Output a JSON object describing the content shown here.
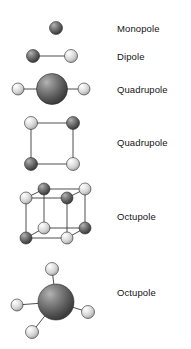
{
  "figure": {
    "background": "#ffffff",
    "bond_color": "#3a3a3a",
    "colors": {
      "sphere_dark": "#4f4f4f",
      "sphere_dark_highlight": "#9a9a9a",
      "sphere_light": "#dcdcdc",
      "sphere_light_highlight": "#ffffff",
      "sphere_mid": "#8a8a8a",
      "sphere_mid_highlight": "#c8c8c8",
      "outline": "#2b2b2b",
      "text": "#141414"
    },
    "rows": [
      {
        "id": "monopole",
        "label": "Monopole",
        "arrangement": "single-sphere",
        "sphere_count": 1,
        "spheres": [
          {
            "cx": 56,
            "cy": 28,
            "r": 6.5,
            "shade": "dark"
          }
        ],
        "bonds": []
      },
      {
        "id": "dipole",
        "label": "Dipole",
        "arrangement": "two-spheres-linear",
        "sphere_count": 2,
        "spheres": [
          {
            "cx": 33,
            "cy": 56,
            "r": 6.5,
            "shade": "dark"
          },
          {
            "cx": 71,
            "cy": 56,
            "r": 6.5,
            "shade": "light"
          }
        ],
        "bonds": [
          {
            "x1": 33,
            "y1": 56,
            "x2": 71,
            "y2": 56
          }
        ]
      },
      {
        "id": "quadrupole-linear",
        "label": "Quadrupole",
        "arrangement": "linear-three-spheres",
        "sphere_count": 3,
        "spheres": [
          {
            "cx": 18,
            "cy": 89,
            "r": 6.0,
            "shade": "light"
          },
          {
            "cx": 52,
            "cy": 89,
            "r": 15.5,
            "shade": "dark"
          },
          {
            "cx": 84,
            "cy": 89,
            "r": 6.0,
            "shade": "light"
          }
        ],
        "bonds": [
          {
            "x1": 18,
            "y1": 89,
            "x2": 52,
            "y2": 89
          },
          {
            "x1": 52,
            "y1": 89,
            "x2": 84,
            "y2": 89
          }
        ]
      },
      {
        "id": "quadrupole-square",
        "label": "Quadrupole",
        "arrangement": "square-four-spheres",
        "sphere_count": 4,
        "spheres": [
          {
            "cx": 31,
            "cy": 123,
            "r": 6.5,
            "shade": "light"
          },
          {
            "cx": 73,
            "cy": 123,
            "r": 6.5,
            "shade": "dark"
          },
          {
            "cx": 31,
            "cy": 164,
            "r": 6.5,
            "shade": "dark"
          },
          {
            "cx": 73,
            "cy": 164,
            "r": 6.5,
            "shade": "light"
          }
        ],
        "bonds": [
          {
            "x1": 31,
            "y1": 123,
            "x2": 73,
            "y2": 123
          },
          {
            "x1": 73,
            "y1": 123,
            "x2": 73,
            "y2": 164
          },
          {
            "x1": 73,
            "y1": 164,
            "x2": 31,
            "y2": 164
          },
          {
            "x1": 31,
            "y1": 164,
            "x2": 31,
            "y2": 123
          }
        ]
      },
      {
        "id": "octupole-cube",
        "label": "Octupole",
        "arrangement": "cube-eight-spheres",
        "sphere_count": 8,
        "spheres": [
          {
            "cx": 26,
            "cy": 198,
            "r": 6.0,
            "shade": "light"
          },
          {
            "cx": 67,
            "cy": 198,
            "r": 6.0,
            "shade": "dark"
          },
          {
            "cx": 26,
            "cy": 238,
            "r": 6.0,
            "shade": "dark"
          },
          {
            "cx": 67,
            "cy": 238,
            "r": 6.0,
            "shade": "light"
          },
          {
            "cx": 44,
            "cy": 189,
            "r": 6.0,
            "shade": "dark"
          },
          {
            "cx": 85,
            "cy": 189,
            "r": 6.0,
            "shade": "light"
          },
          {
            "cx": 44,
            "cy": 228,
            "r": 6.0,
            "shade": "light"
          },
          {
            "cx": 85,
            "cy": 228,
            "r": 6.0,
            "shade": "dark"
          }
        ],
        "bonds": [
          {
            "x1": 26,
            "y1": 198,
            "x2": 67,
            "y2": 198
          },
          {
            "x1": 67,
            "y1": 198,
            "x2": 67,
            "y2": 238
          },
          {
            "x1": 67,
            "y1": 238,
            "x2": 26,
            "y2": 238
          },
          {
            "x1": 26,
            "y1": 238,
            "x2": 26,
            "y2": 198
          },
          {
            "x1": 44,
            "y1": 189,
            "x2": 85,
            "y2": 189
          },
          {
            "x1": 85,
            "y1": 189,
            "x2": 85,
            "y2": 228
          },
          {
            "x1": 85,
            "y1": 228,
            "x2": 44,
            "y2": 228
          },
          {
            "x1": 44,
            "y1": 228,
            "x2": 44,
            "y2": 189
          },
          {
            "x1": 26,
            "y1": 198,
            "x2": 44,
            "y2": 189
          },
          {
            "x1": 67,
            "y1": 198,
            "x2": 85,
            "y2": 189
          },
          {
            "x1": 26,
            "y1": 238,
            "x2": 44,
            "y2": 228
          },
          {
            "x1": 67,
            "y1": 238,
            "x2": 85,
            "y2": 228
          }
        ]
      },
      {
        "id": "octupole-tetrahedral",
        "label": "Octupole",
        "arrangement": "tetrahedral-central-sphere",
        "sphere_count": 5,
        "spheres": [
          {
            "cx": 56,
            "cy": 302,
            "r": 18.0,
            "shade": "dark"
          },
          {
            "cx": 52,
            "cy": 269,
            "r": 6.5,
            "shade": "light"
          },
          {
            "cx": 17,
            "cy": 305,
            "r": 6.0,
            "shade": "light"
          },
          {
            "cx": 88,
            "cy": 312,
            "r": 6.5,
            "shade": "light"
          },
          {
            "cx": 32,
            "cy": 332,
            "r": 6.5,
            "shade": "light"
          }
        ],
        "bonds": [
          {
            "x1": 56,
            "y1": 302,
            "x2": 52,
            "y2": 269
          },
          {
            "x1": 56,
            "y1": 302,
            "x2": 17,
            "y2": 305
          },
          {
            "x1": 56,
            "y1": 302,
            "x2": 88,
            "y2": 312
          },
          {
            "x1": 56,
            "y1": 302,
            "x2": 32,
            "y2": 332
          }
        ]
      }
    ]
  }
}
